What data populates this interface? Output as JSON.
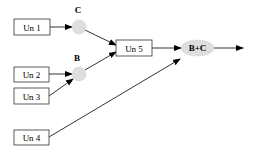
{
  "diagram": {
    "type": "flow",
    "colors": {
      "line": "#000000",
      "node_fill": "#dedede",
      "box_border": "#333333"
    },
    "boxes": [
      {
        "id": "un1",
        "label": "Un 1"
      },
      {
        "id": "un2",
        "label": "Un 2"
      },
      {
        "id": "un3",
        "label": "Un 3"
      },
      {
        "id": "un4",
        "label": "Un 4"
      },
      {
        "id": "un5",
        "label": "Un 5"
      }
    ],
    "nodes": [
      {
        "id": "c",
        "label": "C"
      },
      {
        "id": "b",
        "label": "B"
      },
      {
        "id": "bc",
        "label": "B+C"
      }
    ],
    "edges": [
      {
        "from": "un1",
        "to": "c"
      },
      {
        "from": "un2",
        "to": "b"
      },
      {
        "from": "un3",
        "to": "b"
      },
      {
        "from": "c",
        "to": "un5"
      },
      {
        "from": "b",
        "to": "un5"
      },
      {
        "from": "un5",
        "to": "bc"
      },
      {
        "from": "un4",
        "to": "bc"
      },
      {
        "from": "bc",
        "to": "output"
      }
    ]
  }
}
